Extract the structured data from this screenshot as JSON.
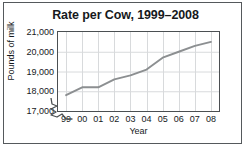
{
  "chart_data": {
    "type": "line",
    "title": "Rate per Cow, 1999–2008",
    "xlabel": "Year",
    "ylabel": "Pounds of milk",
    "categories": [
      "99",
      "00",
      "01",
      "02",
      "03",
      "04",
      "05",
      "06",
      "07",
      "08"
    ],
    "x": [
      1999,
      2000,
      2001,
      2002,
      2003,
      2004,
      2005,
      2006,
      2007,
      2008
    ],
    "values": [
      17800,
      18200,
      18200,
      18600,
      18800,
      19100,
      19700,
      20000,
      20300,
      20500
    ],
    "series": [
      {
        "name": "Pounds of milk per cow",
        "values": [
          17800,
          18200,
          18200,
          18600,
          18800,
          19100,
          19700,
          20000,
          20300,
          20500
        ]
      }
    ],
    "ylim": [
      17000,
      21000
    ],
    "ytick_values": [
      17000,
      18000,
      19000,
      20000,
      21000
    ],
    "ytick_labels": [
      "17,000",
      "18,000",
      "19,000",
      "20,000",
      "21,000"
    ],
    "grid": true,
    "legend": "none",
    "axis_break": true,
    "axis_break_note": "y-axis broken below 17,000",
    "line_color": "#8c8f91",
    "grid_color": "#d8dadc",
    "frame_color": "#4b4f52",
    "text_color": "#16191c"
  }
}
